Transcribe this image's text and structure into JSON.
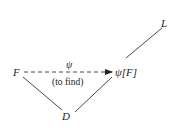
{
  "diagram": {
    "nodes": {
      "F": {
        "label": "F",
        "x": 15,
        "y": 72
      },
      "D": {
        "label": "D",
        "x": 66,
        "y": 117
      },
      "psiF": {
        "label": "ψ[F]",
        "x": 125,
        "y": 72
      },
      "L": {
        "label": "L",
        "x": 165,
        "y": 24
      }
    },
    "edges": [
      {
        "from": "F",
        "to": "D",
        "style": "solid"
      },
      {
        "from": "D",
        "to": "psiF",
        "style": "solid"
      },
      {
        "from": "psiF",
        "to": "L",
        "style": "solid"
      },
      {
        "from": "F",
        "to": "psiF",
        "style": "dashed-arrow",
        "label_above": "ψ",
        "label_below": "(to find)"
      }
    ],
    "line_color": "#333333"
  }
}
